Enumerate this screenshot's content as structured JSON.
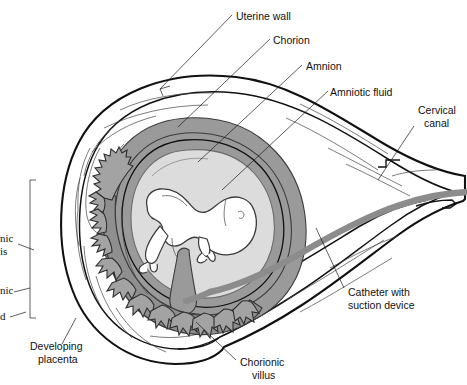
{
  "figure": {
    "background_color": "#ffffff"
  },
  "colors": {
    "outline": "#111111",
    "thin_line": "#444444",
    "amniotic_fluid": "#dcdcdc",
    "chorion_band": "#9a9a9a",
    "villi_gray": "#a3a3a3",
    "placenta_gray": "#8f8f8f",
    "catheter_gray": "#8c8c8c",
    "uterine_wall_fill": "#ffffff",
    "label_text": "#111111"
  },
  "labels": [
    {
      "id": "uterine-wall",
      "text": "Uterine wall",
      "lines": [
        "Uterine wall"
      ],
      "x": 236,
      "y": 12,
      "anchor": "start"
    },
    {
      "id": "chorion",
      "text": "Chorion",
      "lines": [
        "Chorion"
      ],
      "x": 273,
      "y": 36,
      "anchor": "start"
    },
    {
      "id": "amnion",
      "text": "Amnion",
      "lines": [
        "Amnion"
      ],
      "x": 306,
      "y": 62,
      "anchor": "start"
    },
    {
      "id": "amniotic-fluid",
      "text": "Amniotic fluid",
      "lines": [
        "Amniotic fluid"
      ],
      "x": 330,
      "y": 88,
      "anchor": "start"
    },
    {
      "id": "cervical-canal",
      "text": "Cervical canal",
      "lines": [
        "Cervical",
        "canal"
      ],
      "x": 418,
      "y": 114,
      "anchor": "start"
    },
    {
      "id": "catheter",
      "text": "Catheter with suction device",
      "lines": [
        "Catheter with",
        "suction device"
      ],
      "x": 348,
      "y": 296,
      "anchor": "start"
    },
    {
      "id": "developing-placenta",
      "text": "Developing placenta",
      "lines": [
        "Developing",
        "placenta"
      ],
      "x": 30,
      "y": 350,
      "anchor": "start"
    },
    {
      "id": "chorionic-villus",
      "text": "Chorionic villus",
      "lines": [
        "Chorionic",
        "villus"
      ],
      "x": 240,
      "y": 366,
      "anchor": "start"
    }
  ],
  "cropped_labels": [
    {
      "id": "cropped-label-1",
      "lines": [
        "nic",
        "is"
      ],
      "x": 0,
      "y": 240
    },
    {
      "id": "cropped-label-2",
      "lines": [
        "nic"
      ],
      "x": 0,
      "y": 292
    },
    {
      "id": "cropped-label-3",
      "lines": [
        "d"
      ],
      "x": 0,
      "y": 319
    }
  ],
  "structures": [
    {
      "id": "uterine-wall",
      "name": "uterine wall"
    },
    {
      "id": "chorion",
      "name": "chorion"
    },
    {
      "id": "amnion",
      "name": "amnion"
    },
    {
      "id": "amniotic-fluid",
      "name": "amniotic fluid"
    },
    {
      "id": "embryo",
      "name": "embryo"
    },
    {
      "id": "chorionic-villi",
      "name": "chorionic villi"
    },
    {
      "id": "developing-placenta",
      "name": "developing placenta"
    },
    {
      "id": "catheter",
      "name": "catheter with suction device"
    },
    {
      "id": "cervical-canal",
      "name": "cervical canal"
    }
  ]
}
